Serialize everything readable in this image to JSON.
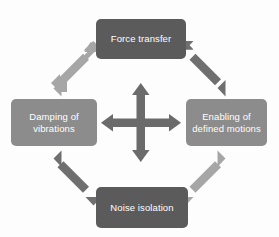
{
  "diagram": {
    "background_color": "#fdfdfd",
    "nodes": [
      {
        "id": "force-transfer",
        "label": "Force transfer",
        "position": "top",
        "fill": "#5b5b5b",
        "text_color": "#ffffff"
      },
      {
        "id": "damping-of-vibrations",
        "label": "Damping of\nvibrations",
        "position": "left",
        "fill": "#8c8c8c",
        "text_color": "#ffffff"
      },
      {
        "id": "enabling-of-defined-motions",
        "label": "Enabling of\ndefined motions",
        "position": "right",
        "fill": "#8c8c8c",
        "text_color": "#ffffff"
      },
      {
        "id": "noise-isolation",
        "label": "Noise isolation",
        "position": "bottom",
        "fill": "#5b5b5b",
        "text_color": "#ffffff"
      }
    ],
    "connectors": [
      {
        "id": "center-cross",
        "kind": "four-way-double-arrow",
        "fill": "#6b6b6b",
        "links": [
          "top",
          "right",
          "bottom",
          "left"
        ]
      },
      {
        "id": "diagonal-top-left",
        "kind": "double-arrow",
        "fill": "#a6a6a6",
        "from": "center",
        "to": "damping-of-vibrations"
      },
      {
        "id": "diagonal-top-right",
        "kind": "double-arrow",
        "fill": "#6f6f6f",
        "from": "force-transfer",
        "to": "enabling-of-defined-motions"
      },
      {
        "id": "diagonal-bottom-left",
        "kind": "double-arrow",
        "fill": "#6f6f6f",
        "from": "damping-of-vibrations",
        "to": "noise-isolation"
      },
      {
        "id": "diagonal-bottom-right",
        "kind": "double-arrow",
        "fill": "#a6a6a6",
        "from": "noise-isolation",
        "to": "enabling-of-defined-motions"
      }
    ]
  }
}
